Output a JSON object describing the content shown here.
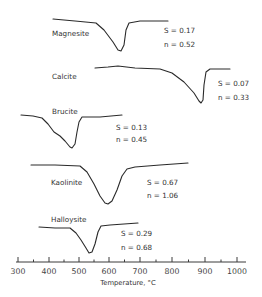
{
  "chart_data": {
    "type": "line",
    "title": "",
    "xlabel": "Temperature, °C",
    "ylabel": "",
    "xlim": [
      300,
      1000
    ],
    "x_ticks": [
      300,
      400,
      500,
      600,
      700,
      800,
      900,
      1000
    ],
    "x_tick_labels": [
      "300",
      "400",
      "500",
      "600",
      "700",
      "800",
      "900",
      "1000"
    ],
    "grid": false,
    "legend": "none (curves labeled inline)",
    "series": [
      {
        "name": "Magnesite",
        "S": "S = 0.17",
        "n": "n = 0.52",
        "x_range": [
          410,
          790
        ],
        "peak_temperature": 645,
        "points_px": [
          [
            53,
            19
          ],
          [
            75,
            21
          ],
          [
            96,
            23
          ],
          [
            104,
            30
          ],
          [
            113,
            42
          ],
          [
            118,
            50
          ],
          [
            121,
            51
          ],
          [
            124,
            45
          ],
          [
            126,
            30
          ],
          [
            129,
            23
          ],
          [
            140,
            21
          ],
          [
            168,
            21
          ]
        ]
      },
      {
        "name": "Calcite",
        "S": "S = 0.07",
        "n": "n = 0.33",
        "x_range": [
          560,
          1000
        ],
        "peak_temperature": 890,
        "points_px": [
          [
            95,
            68
          ],
          [
            108,
            67
          ],
          [
            118,
            66
          ],
          [
            135,
            68
          ],
          [
            160,
            69
          ],
          [
            172,
            73
          ],
          [
            184,
            82
          ],
          [
            194,
            93
          ],
          [
            199,
            101
          ],
          [
            201,
            103
          ],
          [
            203,
            100
          ],
          [
            204,
            85
          ],
          [
            206,
            72
          ],
          [
            210,
            69
          ],
          [
            230,
            69
          ]
        ]
      },
      {
        "name": "Brucite",
        "S": "S = 0.13",
        "n": "n = 0.45",
        "x_range": [
          310,
          645
        ],
        "peak_temperature": 480,
        "points_px": [
          [
            21,
            115
          ],
          [
            33,
            116
          ],
          [
            42,
            118
          ],
          [
            48,
            124
          ],
          [
            54,
            132
          ],
          [
            60,
            136
          ],
          [
            65,
            141
          ],
          [
            70,
            147
          ],
          [
            72,
            148
          ],
          [
            75,
            144
          ],
          [
            77,
            132
          ],
          [
            79,
            122
          ],
          [
            82,
            117
          ],
          [
            100,
            117
          ],
          [
            122,
            115
          ]
        ]
      },
      {
        "name": "Kaolinite",
        "S": "S = 0.67",
        "n": "n = 1.06",
        "x_range": [
          345,
          860
        ],
        "peak_temperature": 600,
        "points_px": [
          [
            31,
            165
          ],
          [
            55,
            165
          ],
          [
            80,
            166
          ],
          [
            87,
            172
          ],
          [
            94,
            184
          ],
          [
            100,
            196
          ],
          [
            105,
            203
          ],
          [
            108,
            204
          ],
          [
            112,
            201
          ],
          [
            117,
            190
          ],
          [
            122,
            176
          ],
          [
            127,
            169
          ],
          [
            135,
            167
          ],
          [
            160,
            165
          ],
          [
            188,
            163
          ]
        ]
      },
      {
        "name": "Halloysite",
        "S": "S = 0.29",
        "n": "n = 0.68",
        "x_range": [
          370,
          700
        ],
        "peak_temperature": 540,
        "points_px": [
          [
            39,
            227
          ],
          [
            55,
            228
          ],
          [
            70,
            228
          ],
          [
            76,
            233
          ],
          [
            81,
            240
          ],
          [
            86,
            248
          ],
          [
            89,
            253
          ],
          [
            92,
            252
          ],
          [
            95,
            244
          ],
          [
            98,
            232
          ],
          [
            101,
            226
          ],
          [
            110,
            225
          ],
          [
            138,
            223
          ]
        ]
      }
    ]
  },
  "labels": {
    "magnesite": {
      "name": "Magnesite",
      "s": "S = 0.17",
      "n": "n = 0.52"
    },
    "calcite": {
      "name": "Calcite",
      "s": "S = 0.07",
      "n": "n = 0.33"
    },
    "brucite": {
      "name": "Brucite",
      "s": "S = 0.13",
      "n": "n = 0.45"
    },
    "kaolinite": {
      "name": "Kaolinite",
      "s": "S = 0.67",
      "n": "n = 1.06"
    },
    "halloysite": {
      "name": "Halloysite",
      "s": "S = 0.29",
      "n": "n = 0.68"
    }
  },
  "axis": {
    "title": "Temperature, °C",
    "ticks": [
      "300",
      "400",
      "500",
      "600",
      "700",
      "800",
      "900",
      "1000"
    ]
  }
}
